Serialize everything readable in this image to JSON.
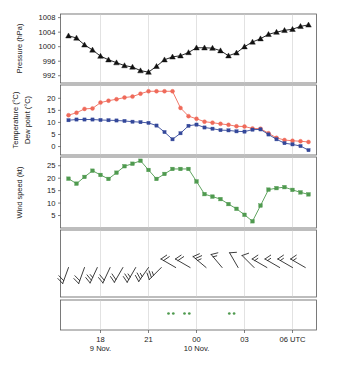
{
  "figure": {
    "title": "",
    "width": 337,
    "height": 368
  },
  "colors": {
    "pressure": "#111111",
    "temperature": "#ef6a5a",
    "temperature_label": "#f08070",
    "dewpoint": "#34489a",
    "dewpoint_label": "#3a5090",
    "windspeed": "#4f9a4f",
    "precip_symbol": "#4f9a4f",
    "frame": "#5a5a5a",
    "grid": "#c9c9c9",
    "text": "#1a1a1a"
  },
  "xaxis": {
    "ticks": [
      {
        "label": "18",
        "hour": 18
      },
      {
        "label": "21",
        "hour": 21
      },
      {
        "label": "00",
        "hour": 0
      },
      {
        "label": "03",
        "hour": 3
      },
      {
        "label": "06 UTC",
        "hour": 6
      }
    ],
    "date_labels": [
      {
        "label": "9 Nov.",
        "at_tick": 0
      },
      {
        "label": "10 Nov.",
        "at_tick": 2
      }
    ],
    "range_hours": [
      15.5,
      7.5
    ],
    "grid": true
  },
  "chart_data": [
    {
      "type": "line",
      "panel": "pressure",
      "title": "",
      "ylabel": "Pressure (hPa)",
      "xlabel": "",
      "ylim": [
        990,
        1009
      ],
      "yticks": [
        992,
        996,
        1000,
        1004,
        1008
      ],
      "marker": "triangle-up",
      "color": "#111111",
      "x": [
        16.0,
        16.5,
        17.0,
        17.5,
        18.0,
        18.5,
        19.0,
        19.5,
        20.0,
        20.5,
        21.0,
        21.5,
        22.0,
        22.5,
        23.0,
        23.5,
        0.0,
        0.5,
        1.0,
        1.5,
        2.0,
        2.5,
        3.0,
        3.5,
        4.0,
        4.5,
        5.0,
        5.5,
        6.0,
        6.5,
        7.0
      ],
      "values": [
        1003.0,
        1002.4,
        1000.5,
        999.1,
        997.4,
        996.4,
        995.6,
        994.8,
        994.4,
        993.4,
        993.0,
        994.6,
        996.4,
        997.2,
        997.5,
        998.4,
        999.7,
        999.7,
        999.6,
        998.9,
        997.5,
        998.3,
        1000.0,
        1001.3,
        1002.2,
        1003.4,
        1004.0,
        1004.5,
        1004.8,
        1005.6,
        1006.0
      ],
      "series_name": "Pressure"
    },
    {
      "type": "line",
      "panel": "temperature_dewpoint",
      "title": "",
      "ylabel_1": "Temperature (°C)",
      "ylabel_2": "Dew point (°C)",
      "xlabel": "",
      "ylim": [
        -3.5,
        25.5
      ],
      "yticks": [
        0,
        5,
        10,
        15,
        20
      ],
      "x": [
        16.0,
        16.5,
        17.0,
        17.5,
        18.0,
        18.5,
        19.0,
        19.5,
        20.0,
        20.5,
        21.0,
        21.5,
        22.0,
        22.5,
        23.0,
        23.5,
        0.0,
        0.5,
        1.0,
        1.5,
        2.0,
        2.5,
        3.0,
        3.5,
        4.0,
        4.5,
        5.0,
        5.5,
        6.0,
        6.5,
        7.0
      ],
      "series": [
        {
          "name": "Temperature",
          "color": "#ef6a5a",
          "marker": "circle",
          "values": [
            13.0,
            14.0,
            15.6,
            15.8,
            18.2,
            19.0,
            19.6,
            20.3,
            20.7,
            21.9,
            22.9,
            22.9,
            22.9,
            22.9,
            16.0,
            12.6,
            11.5,
            10.3,
            9.9,
            9.4,
            9.0,
            8.4,
            8.3,
            7.5,
            7.4,
            5.5,
            3.6,
            2.7,
            2.4,
            2.2,
            1.9
          ]
        },
        {
          "name": "Dew point",
          "color": "#34489a",
          "marker": "square",
          "values": [
            10.9,
            11.2,
            11.2,
            11.2,
            11.0,
            10.9,
            10.8,
            10.6,
            10.3,
            10.1,
            9.8,
            8.7,
            6.0,
            3.0,
            5.5,
            8.6,
            9.1,
            7.9,
            7.4,
            6.8,
            6.7,
            6.3,
            6.2,
            7.0,
            7.1,
            5.0,
            3.0,
            1.4,
            0.9,
            0.2,
            -1.5
          ]
        }
      ]
    },
    {
      "type": "line",
      "panel": "windspeed",
      "title": "",
      "ylabel": "Wind speed (kt)",
      "xlabel": "",
      "ylim": [
        0,
        28.5
      ],
      "yticks": [
        5,
        10,
        15,
        20,
        25
      ],
      "marker": "square",
      "color": "#4f9a4f",
      "series_name": "Wind speed",
      "x": [
        16.0,
        16.5,
        17.0,
        17.5,
        18.0,
        18.5,
        19.0,
        19.5,
        20.0,
        20.5,
        21.0,
        21.5,
        22.0,
        22.5,
        23.0,
        23.5,
        0.0,
        0.5,
        1.0,
        1.5,
        2.0,
        2.5,
        3.0,
        3.5,
        4.0,
        4.5,
        5.0,
        5.5,
        6.0,
        6.5,
        7.0
      ],
      "values": [
        19.8,
        17.8,
        20.5,
        23.0,
        21.3,
        19.7,
        22.2,
        24.8,
        25.8,
        27.0,
        23.3,
        19.7,
        21.7,
        23.7,
        23.7,
        23.7,
        18.7,
        13.6,
        12.6,
        11.6,
        9.6,
        7.7,
        5.3,
        2.7,
        9.0,
        15.4,
        16.0,
        16.4,
        15.3,
        14.3,
        13.5
      ]
    },
    {
      "type": "windbarbs",
      "panel": "wind_barbs",
      "title": "",
      "ylabel": "",
      "barbs": [
        {
          "x": 16.0,
          "direction_deg": 200,
          "speed_kt": 20
        },
        {
          "x": 17.0,
          "direction_deg": 200,
          "speed_kt": 20
        },
        {
          "x": 17.8,
          "direction_deg": 205,
          "speed_kt": 23
        },
        {
          "x": 18.6,
          "direction_deg": 205,
          "speed_kt": 21
        },
        {
          "x": 19.4,
          "direction_deg": 210,
          "speed_kt": 22
        },
        {
          "x": 20.2,
          "direction_deg": 210,
          "speed_kt": 25
        },
        {
          "x": 21.0,
          "direction_deg": 215,
          "speed_kt": 27
        },
        {
          "x": 21.8,
          "direction_deg": 225,
          "speed_kt": 23
        },
        {
          "x": 22.7,
          "direction_deg": 300,
          "speed_kt": 20
        },
        {
          "x": 23.6,
          "direction_deg": 300,
          "speed_kt": 22
        },
        {
          "x": 0.6,
          "direction_deg": 310,
          "speed_kt": 24
        },
        {
          "x": 1.6,
          "direction_deg": 320,
          "speed_kt": 14
        },
        {
          "x": 2.6,
          "direction_deg": 330,
          "speed_kt": 12
        },
        {
          "x": 3.6,
          "direction_deg": 315,
          "speed_kt": 9
        },
        {
          "x": 4.4,
          "direction_deg": 300,
          "speed_kt": 15
        },
        {
          "x": 5.2,
          "direction_deg": 300,
          "speed_kt": 16
        },
        {
          "x": 6.0,
          "direction_deg": 300,
          "speed_kt": 16
        },
        {
          "x": 6.8,
          "direction_deg": 300,
          "speed_kt": 14
        }
      ]
    },
    {
      "type": "scatter",
      "panel": "present_weather",
      "title": "",
      "ylabel": "",
      "symbol": "drizzle-two-dots",
      "color": "#4f9a4f",
      "events": [
        {
          "x": 22.4,
          "label": "drizzle"
        },
        {
          "x": 23.4,
          "label": "drizzle"
        },
        {
          "x": 2.2,
          "label": "drizzle"
        }
      ]
    }
  ],
  "panels": {
    "pressure_label": "Pressure (hPa)",
    "temperature_label": "Temperature (°C)",
    "dewpoint_label": "Dew point (°C)",
    "windspeed_label": "Wind speed (kt)"
  }
}
